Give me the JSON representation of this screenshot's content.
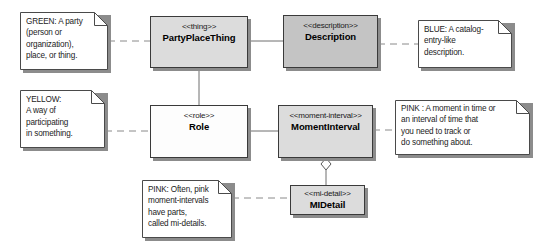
{
  "diagram": {
    "background": "#ffffff",
    "colors": {
      "box_border": "#3a3a3a",
      "box_shadow": "#8c8c8c",
      "fill_light_gray": "#dcdcdc",
      "fill_dark_gray": "#c4c4c4",
      "fill_white": "#fdfdfd",
      "connector": "#6e6e6e",
      "note_fill": "#ffffff",
      "text": "#1a1a1a"
    },
    "classes": [
      {
        "id": "party-place-thing",
        "stereotype": "<<thing>>",
        "name": "PartyPlaceThing",
        "fill": "#dcdcdc",
        "x": 150,
        "y": 16,
        "w": 98,
        "h": 52
      },
      {
        "id": "description",
        "stereotype": "<<description>>",
        "name": "Description",
        "fill": "#c4c4c4",
        "x": 283,
        "y": 15,
        "w": 95,
        "h": 53
      },
      {
        "id": "role",
        "stereotype": "<<role>>",
        "name": "Role",
        "fill": "#fdfdfd",
        "x": 150,
        "y": 105,
        "w": 98,
        "h": 53
      },
      {
        "id": "moment-interval",
        "stereotype": "<<moment-interval>>",
        "name": "MomentInterval",
        "fill": "#dcdcdc",
        "x": 278,
        "y": 105,
        "w": 95,
        "h": 53
      },
      {
        "id": "mi-detail",
        "stereotype": "<<mi-detail>>",
        "name": "MIDetail",
        "fill": "#dcdcdc",
        "x": 290,
        "y": 185,
        "w": 75,
        "h": 30
      }
    ],
    "notes": [
      {
        "id": "note-green",
        "archetype": "GREEN",
        "lines": [
          "GREEN: A party",
          "(person or",
          "organization),",
          "place, or thing."
        ],
        "x": 20,
        "y": 12,
        "w": 88,
        "h": 58,
        "fold": 13
      },
      {
        "id": "note-blue",
        "archetype": "BLUE",
        "lines": [
          "BLUE: A catalog-",
          "entry-like",
          "description."
        ],
        "x": 418,
        "y": 20,
        "w": 94,
        "h": 48,
        "fold": 13
      },
      {
        "id": "note-yellow",
        "archetype": "YELLOW",
        "lines": [
          "YELLOW:",
          "A way of",
          "participating",
          " in something."
        ],
        "x": 20,
        "y": 90,
        "w": 85,
        "h": 58,
        "fold": 13
      },
      {
        "id": "note-pink-right",
        "archetype": "PINK",
        "lines": [
          "PINK : A moment in time or",
          " an interval of time that",
          "you need to track or",
          "do something about."
        ],
        "x": 395,
        "y": 100,
        "w": 135,
        "h": 55,
        "fold": 13
      },
      {
        "id": "note-pink-bottom",
        "archetype": "PINK",
        "lines": [
          "PINK: Often, pink",
          "moment-intervals",
          "have parts,",
          "called mi-details."
        ],
        "x": 142,
        "y": 180,
        "w": 90,
        "h": 58,
        "fold": 13
      }
    ],
    "connectors": [
      {
        "id": "party-to-description",
        "kind": "association",
        "from": "party-place-thing",
        "to": "description"
      },
      {
        "id": "party-to-role",
        "kind": "association",
        "from": "party-place-thing",
        "to": "role"
      },
      {
        "id": "role-to-moment-interval",
        "kind": "association",
        "from": "role",
        "to": "moment-interval"
      },
      {
        "id": "moment-interval-to-mi-detail",
        "kind": "aggregation",
        "from": "moment-interval",
        "to": "mi-detail"
      },
      {
        "id": "note-green-link",
        "kind": "note-anchor",
        "from": "note-green",
        "to": "party-place-thing"
      },
      {
        "id": "note-blue-link",
        "kind": "note-anchor",
        "from": "note-blue",
        "to": "description"
      },
      {
        "id": "note-yellow-link",
        "kind": "note-anchor",
        "from": "note-yellow",
        "to": "role"
      },
      {
        "id": "note-pink-right-link",
        "kind": "note-anchor",
        "from": "note-pink-right",
        "to": "moment-interval"
      },
      {
        "id": "note-pink-bottom-link",
        "kind": "note-anchor",
        "from": "note-pink-bottom",
        "to": "mi-detail"
      }
    ]
  }
}
